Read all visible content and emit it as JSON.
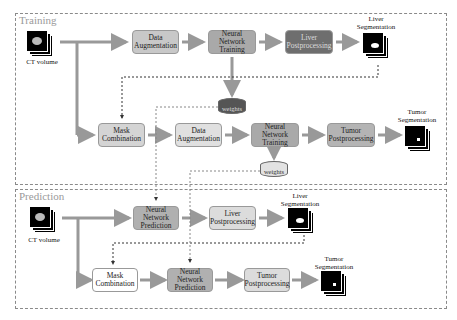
{
  "training": {
    "title": "Training",
    "ct_label": "CT volume",
    "row1": {
      "data_aug": [
        "Data",
        "Augmentation"
      ],
      "nn_train": [
        "Neural Network",
        "Training"
      ],
      "liver_post": [
        "Liver",
        "Postprocessing"
      ],
      "out_label": [
        "Liver",
        "Segmentation"
      ]
    },
    "weights1": "weights",
    "row2": {
      "mask_comb": [
        "Mask",
        "Combination"
      ],
      "data_aug": [
        "Data",
        "Augmentation"
      ],
      "nn_train": [
        "Neural Network",
        "Training"
      ],
      "tumor_post": [
        "Tumor",
        "Postprocessing"
      ],
      "out_label": [
        "Tumor",
        "Segmentation"
      ]
    },
    "weights2": "weights"
  },
  "prediction": {
    "title": "Prediction",
    "ct_label": "CT volume",
    "row1": {
      "nn_pred": [
        "Neural Network",
        "Prediction"
      ],
      "liver_post": [
        "Liver",
        "Postprocessing"
      ],
      "out_label": [
        "Liver",
        "Segmentation"
      ]
    },
    "row2": {
      "mask_comb": [
        "Mask",
        "Combination"
      ],
      "nn_pred": [
        "Neural Network",
        "Prediction"
      ],
      "tumor_post": [
        "Tumor",
        "Postprocessing"
      ],
      "out_label": [
        "Tumor",
        "Segmentation"
      ]
    }
  },
  "colors": {
    "data_aug": "#c8c8c8",
    "nn_train": "#a9a9a9",
    "liver_post_dark": "#6e6e6e",
    "mask_comb": "#d4d4d4",
    "tumor_post": "#b4b4b4",
    "pred_nn": "#b0b0b0",
    "pred_post": "#dcdcdc",
    "pred_mask": "#ffffff"
  }
}
